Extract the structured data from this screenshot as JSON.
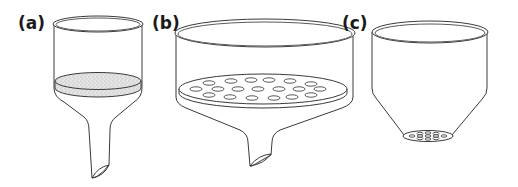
{
  "figure": {
    "panels": [
      {
        "id": "a",
        "label": "(a)",
        "description": "Funnel with sintered glass (fritted) disc filter"
      },
      {
        "id": "b",
        "label": "(b)",
        "description": "Büchner funnel with perforated plate"
      },
      {
        "id": "c",
        "label": "(c)",
        "description": "Hirsch-type conical funnel with small perforated base"
      }
    ]
  },
  "colors": {
    "stroke": "#3a3a3a",
    "background": "#ffffff",
    "frit_fill": "#d8d8d8",
    "label": "#1a1a1a"
  }
}
